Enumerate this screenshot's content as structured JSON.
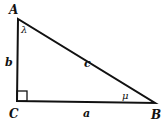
{
  "diagram": {
    "vertices": [
      {
        "name": "A",
        "x": 18,
        "y": 19
      },
      {
        "name": "B",
        "x": 155,
        "y": 103
      },
      {
        "name": "C",
        "x": 17,
        "y": 101
      }
    ],
    "sides": {
      "a": "a",
      "b": "b",
      "c": "c"
    },
    "angles": {
      "at_A": "λ",
      "at_B": "μ",
      "at_C": "right angle"
    },
    "labels": {
      "A": "A",
      "B": "B",
      "C": "C",
      "a": "a",
      "b": "b",
      "c": "c",
      "lambda": "λ",
      "mu": "μ"
    },
    "stroke_color": "#111111"
  }
}
